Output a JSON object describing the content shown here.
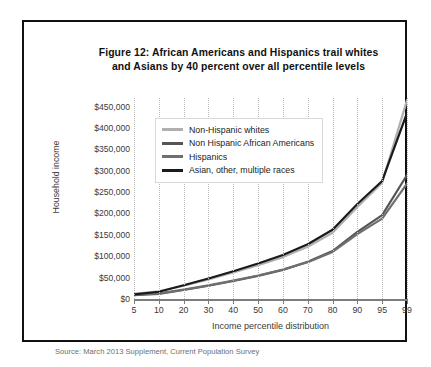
{
  "figure": {
    "title_line1": "Figure 12: African Americans and Hispanics trail whites",
    "title_line2": "and Asians by 40 percent over all percentile levels",
    "source": "Source: March 2013 Supplement, Current Population Survey"
  },
  "chart_data": {
    "type": "line",
    "title": "Figure 12: African Americans and Hispanics trail whites and Asians by 40 percent over all percentile levels",
    "xlabel": "Income percentile distribution",
    "ylabel": "Household income",
    "categories": [
      "5",
      "10",
      "20",
      "30",
      "40",
      "50",
      "60",
      "70",
      "80",
      "90",
      "95",
      "99"
    ],
    "x_tick_labels": [
      "5",
      "10",
      "20",
      "30",
      "40",
      "50",
      "60",
      "70",
      "80",
      "90",
      "95",
      "99"
    ],
    "y_tick_labels": [
      "$0",
      "$50,000",
      "$100,000",
      "$150,000",
      "$200,000",
      "$250,000",
      "$300,000",
      "$350,000",
      "$400,000",
      "$450,000"
    ],
    "y_tick_values": [
      0,
      50000,
      100000,
      150000,
      200000,
      250000,
      300000,
      350000,
      400000,
      450000
    ],
    "ylim": [
      0,
      470000
    ],
    "grid": "vertical-dotted",
    "legend_position": "upper-left-inside",
    "series": [
      {
        "name": "Non-Hispanic whites",
        "color": "#b0b0b0",
        "values": [
          12000,
          18000,
          31000,
          46000,
          62000,
          79000,
          98000,
          122000,
          155000,
          215000,
          272000,
          465000
        ]
      },
      {
        "name": "Non Hispanic African Americans",
        "color": "#555555",
        "values": [
          9000,
          12000,
          21000,
          31000,
          42000,
          54000,
          68000,
          87000,
          112000,
          157000,
          196000,
          290000
        ]
      },
      {
        "name": "Hispanics",
        "color": "#6f6f6f",
        "values": [
          10000,
          13000,
          22000,
          32000,
          43000,
          55000,
          69000,
          86000,
          110000,
          152000,
          188000,
          270000
        ]
      },
      {
        "name": "Asian, other, multiple races",
        "color": "#1a1a1a",
        "values": [
          11000,
          17000,
          32000,
          48000,
          65000,
          83000,
          103000,
          128000,
          162000,
          222000,
          276000,
          435000
        ]
      }
    ]
  }
}
